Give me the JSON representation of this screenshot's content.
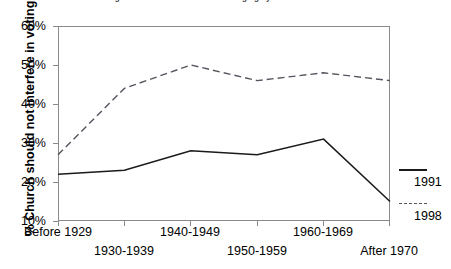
{
  "chart_data": {
    "type": "line",
    "title": "Religious Attitudes and Politics Changing by Birth Cohort",
    "xlabel": "",
    "ylabel": "% Church should not interfere in voting",
    "categories": [
      "Before 1929",
      "1930-1939",
      "1940-1949",
      "1950-1959",
      "1960-1969",
      "After 1970"
    ],
    "ylim": [
      10,
      60
    ],
    "yticks": [
      10,
      20,
      30,
      40,
      50,
      60
    ],
    "ytick_labels": [
      "10%",
      "20%",
      "30%",
      "40%",
      "50%",
      "60%"
    ],
    "grid": false,
    "legend_position": "right",
    "series": [
      {
        "name": "1991",
        "style": "solid",
        "color": "#1a1a1a",
        "values": [
          22,
          23,
          28,
          27,
          31,
          15
        ]
      },
      {
        "name": "1998",
        "style": "dashed",
        "color": "#55555f",
        "values": [
          27,
          44,
          50,
          46,
          48,
          46
        ]
      }
    ]
  },
  "axes": {
    "y_title": "% Church should not interfere in voting"
  },
  "legend": {
    "entries": [
      {
        "label": "1991",
        "style": "solid"
      },
      {
        "label": "1998",
        "style": "dashed"
      }
    ]
  }
}
